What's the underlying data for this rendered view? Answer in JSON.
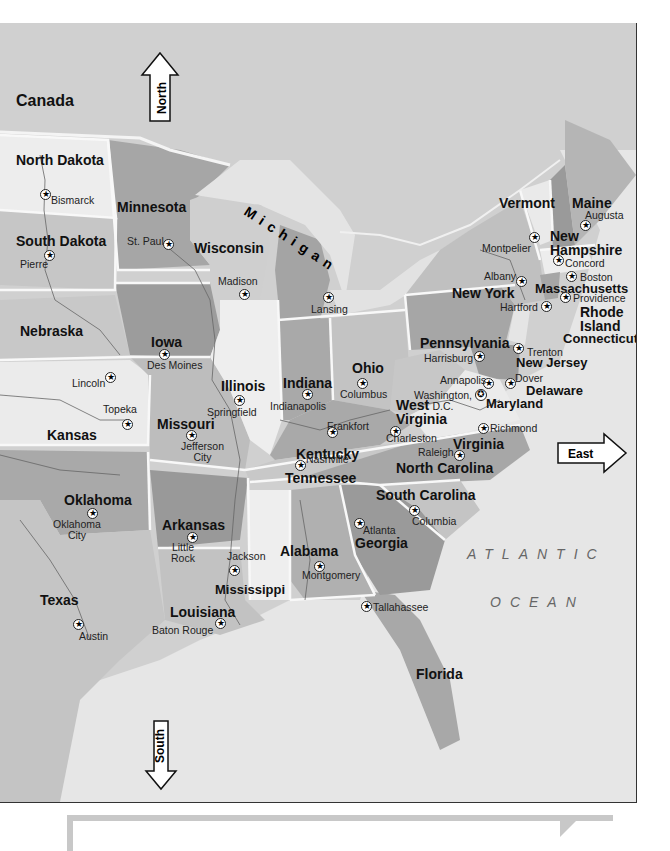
{
  "map": {
    "title": "Eastern United States",
    "country_label": "Canada",
    "directions": {
      "north": "North",
      "south": "South",
      "east": "East"
    },
    "ocean": {
      "line1": "ATLANTIC",
      "line2": "OCEAN"
    },
    "lake_label": "Michigan",
    "states": [
      {
        "name": "North Dakota",
        "capital": "Bismarck"
      },
      {
        "name": "South Dakota",
        "capital": "Pierre"
      },
      {
        "name": "Minnesota",
        "capital": "St. Paul"
      },
      {
        "name": "Wisconsin",
        "capital": "Madison"
      },
      {
        "name": "Michigan",
        "capital": "Lansing"
      },
      {
        "name": "Nebraska",
        "capital": "Lincoln"
      },
      {
        "name": "Iowa",
        "capital": "Des Moines"
      },
      {
        "name": "Illinois",
        "capital": "Springfield"
      },
      {
        "name": "Indiana",
        "capital": "Indianapolis"
      },
      {
        "name": "Ohio",
        "capital": "Columbus"
      },
      {
        "name": "Kansas",
        "capital": "Topeka"
      },
      {
        "name": "Missouri",
        "capital": "Jefferson City"
      },
      {
        "name": "Kentucky",
        "capital": "Frankfort"
      },
      {
        "name": "West Virginia",
        "capital": "Charleston"
      },
      {
        "name": "Virginia",
        "capital": "Richmond"
      },
      {
        "name": "Pennsylvania",
        "capital": "Harrisburg"
      },
      {
        "name": "New York",
        "capital": "Albany"
      },
      {
        "name": "Vermont",
        "capital": "Montpelier"
      },
      {
        "name": "New Hampshire",
        "capital": "Concord"
      },
      {
        "name": "Maine",
        "capital": "Augusta"
      },
      {
        "name": "Massachusetts",
        "capital": "Boston"
      },
      {
        "name": "Rhode Island",
        "capital": "Providence"
      },
      {
        "name": "Connecticut",
        "capital": "Hartford"
      },
      {
        "name": "New Jersey",
        "capital": "Trenton"
      },
      {
        "name": "Delaware",
        "capital": "Dover"
      },
      {
        "name": "Maryland",
        "capital": "Annapolis"
      },
      {
        "name": "Oklahoma",
        "capital": "Oklahoma City"
      },
      {
        "name": "Arkansas",
        "capital": "Little Rock"
      },
      {
        "name": "Tennessee",
        "capital": "Nashville"
      },
      {
        "name": "North Carolina",
        "capital": "Raleigh"
      },
      {
        "name": "South Carolina",
        "capital": "Columbia"
      },
      {
        "name": "Georgia",
        "capital": "Atlanta"
      },
      {
        "name": "Alabama",
        "capital": "Montgomery"
      },
      {
        "name": "Mississippi",
        "capital": "Jackson"
      },
      {
        "name": "Louisiana",
        "capital": "Baton Rouge"
      },
      {
        "name": "Texas",
        "capital": "Austin"
      },
      {
        "name": "Florida",
        "capital": "Tallahassee"
      }
    ],
    "federal_district": {
      "name_line1": "Washington,",
      "name_line2": "D.C."
    },
    "labels": {
      "new_hampshire_line1": "New",
      "new_hampshire_line2": "Hampshire",
      "rhode_island_line1": "Rhode",
      "rhode_island_line2": "Island",
      "west_virginia_line1": "West",
      "west_virginia_line2": "Virginia",
      "jefferson_city_line1": "Jefferson",
      "jefferson_city_line2": "City",
      "oklahoma_city_line1": "Oklahoma",
      "oklahoma_city_line2": "City",
      "little_rock_line1": "Little",
      "little_rock_line2": "Rock"
    },
    "colors": {
      "land_light": "#ececec",
      "land_mid": "#c9c9c9",
      "land_dark": "#9e9e9e",
      "water": "#e6e6e6",
      "border": "#f8f8f8",
      "panel_border": "#c8c8c8"
    }
  },
  "bottom_panel": {
    "text": ""
  }
}
